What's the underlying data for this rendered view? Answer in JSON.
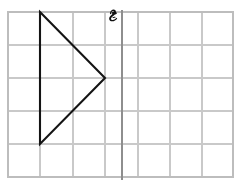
{
  "figure": {
    "title": "",
    "background_color": "#ffffff",
    "width": 240,
    "height": 184
  },
  "grid": {
    "name": "graph-paper-grid",
    "columns": 7,
    "rows": 5,
    "line_color": "#c9c9c9",
    "border_color": "#bdbdbd",
    "x_positions": [
      8,
      40,
      73,
      105,
      138,
      170,
      202,
      233
    ],
    "y_positions": [
      12,
      45,
      78,
      111,
      144,
      177
    ]
  },
  "axis": {
    "name": "vertical-axis-line",
    "orientation": "vertical",
    "x": 122,
    "y_start": 8,
    "y_end": 180,
    "color": "#8e8e8e"
  },
  "shapes": [
    {
      "name": "triangle",
      "type": "polygon",
      "stroke_color": "#141414",
      "fill": "none",
      "points": [
        {
          "x": 40,
          "y": 12
        },
        {
          "x": 105,
          "y": 78
        },
        {
          "x": 40,
          "y": 144
        }
      ],
      "points_text": "40,12 105,78 40,144"
    }
  ],
  "annotations": [
    {
      "name": "handwritten-pen-mark",
      "type": "pen-stroke",
      "x": 112,
      "y": 16,
      "color": "#101010",
      "label": ""
    }
  ]
}
